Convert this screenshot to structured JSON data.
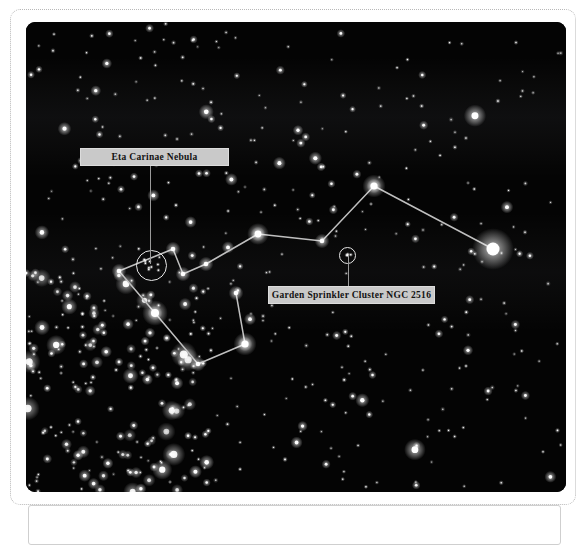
{
  "page": {
    "background_color": "#ffffff",
    "frame_border_color": "#b8b8b8"
  },
  "sky_figure": {
    "name": "carina-constellation-star-chart",
    "background_color": "#040404",
    "width": 540,
    "height": 470,
    "line_color": "#bfbfbf",
    "star_color": "#ffffff"
  },
  "annotations": [
    {
      "id": "eta-carinae-nebula",
      "label": "Eta Carinae Nebula",
      "marker_shape": "circle",
      "marker_radius_px": 15,
      "box_color": "#c9c9c9",
      "text_color": "#121212"
    },
    {
      "id": "garden-sprinkler-cluster",
      "label": "Garden Sprinkler Cluster NGC 2516",
      "marker_shape": "circle",
      "marker_radius_px": 8,
      "box_color": "#c9c9c9",
      "text_color": "#121212"
    }
  ],
  "chart_data": {
    "type": "scatter",
    "title": "",
    "xlabel": "",
    "ylabel": "",
    "xlim": [
      0,
      540
    ],
    "ylim": [
      0,
      470
    ],
    "grid": false,
    "legend": "none",
    "constellation_name": "Carina",
    "constellation_vertices": [
      {
        "name": "v1",
        "x": 93,
        "y": 249
      },
      {
        "name": "v2",
        "x": 147,
        "y": 227
      },
      {
        "name": "v3",
        "x": 157,
        "y": 252
      },
      {
        "name": "v4",
        "x": 180,
        "y": 242
      },
      {
        "name": "v5",
        "x": 232,
        "y": 212
      },
      {
        "name": "v6",
        "x": 296,
        "y": 219
      },
      {
        "name": "v7",
        "x": 348,
        "y": 164
      },
      {
        "name": "v8",
        "x": 467,
        "y": 227
      },
      {
        "name": "v9",
        "x": 129,
        "y": 291
      },
      {
        "name": "v10",
        "x": 172,
        "y": 342
      },
      {
        "name": "v11",
        "x": 219,
        "y": 322
      },
      {
        "name": "v12",
        "x": 210,
        "y": 271
      }
    ],
    "constellation_segments": [
      [
        "v1",
        "v2"
      ],
      [
        "v2",
        "v3"
      ],
      [
        "v3",
        "v4"
      ],
      [
        "v4",
        "v5"
      ],
      [
        "v5",
        "v6"
      ],
      [
        "v6",
        "v7"
      ],
      [
        "v7",
        "v8"
      ],
      [
        "v1",
        "v9"
      ],
      [
        "v9",
        "v10"
      ],
      [
        "v10",
        "v11"
      ],
      [
        "v11",
        "v12"
      ]
    ],
    "named_stars": [
      {
        "name": "Canopus",
        "x": 467,
        "y": 227,
        "magnitude_px": 6.5
      },
      {
        "name": "Miaplacidus",
        "x": 129,
        "y": 291,
        "magnitude_px": 4.0
      },
      {
        "name": "Avior",
        "x": 348,
        "y": 164,
        "magnitude_px": 3.6
      },
      {
        "name": "Aspidiske",
        "x": 232,
        "y": 212,
        "magnitude_px": 3.4
      },
      {
        "name": "Theta Carinae",
        "x": 219,
        "y": 322,
        "magnitude_px": 3.6
      }
    ],
    "deep_sky_objects": [
      {
        "name": "Eta Carinae Nebula",
        "x": 125,
        "y": 243,
        "marker": "circle",
        "radius_px": 15
      },
      {
        "name": "Garden Sprinkler Cluster NGC 2516",
        "x": 321,
        "y": 233,
        "marker": "circle",
        "radius_px": 8
      }
    ],
    "milky_way_bands": [
      {
        "y": 95,
        "opacity": 0.05
      },
      {
        "y": 250,
        "opacity": 0.04
      }
    ],
    "background_star_count": 520
  }
}
